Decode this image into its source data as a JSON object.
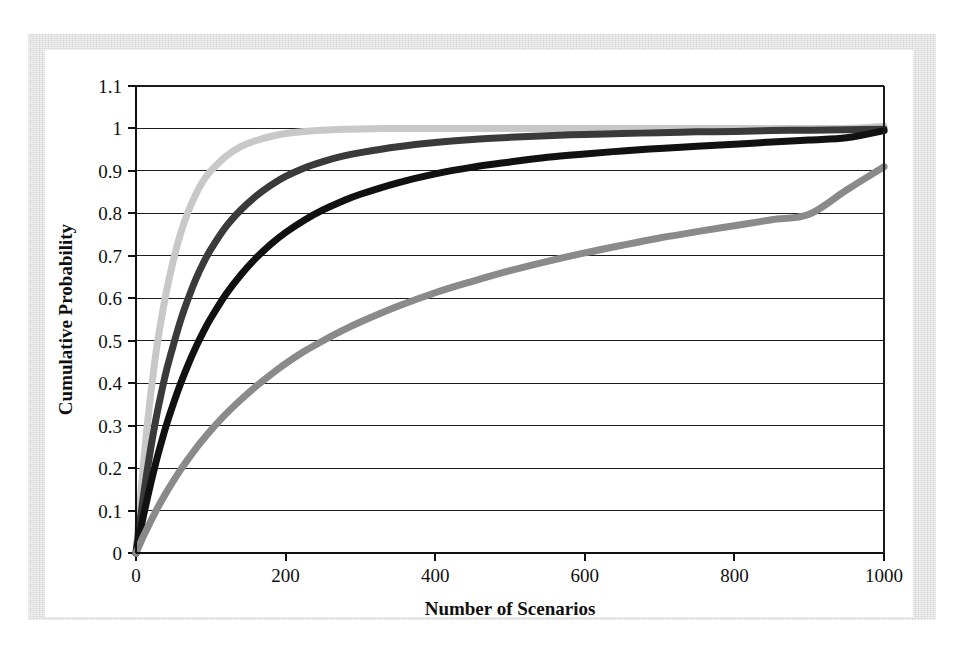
{
  "figure": {
    "kind": "scanned-figure-plate",
    "frame_color": "#dedede",
    "plate_color": "#ffffff"
  },
  "chart_data": {
    "type": "line",
    "title": "",
    "subtitle": "",
    "xlabel": "Number of Scenarios",
    "ylabel": "Cumulative Probability",
    "xlim": [
      0,
      1000
    ],
    "ylim": [
      0,
      1.1
    ],
    "xticks": [
      0,
      200,
      400,
      600,
      800,
      1000
    ],
    "xtick_labels": [
      "0",
      "200",
      "400",
      "600",
      "800",
      "1000"
    ],
    "yticks": [
      0,
      0.1,
      0.2,
      0.3,
      0.4,
      0.5,
      0.6,
      0.7,
      0.8,
      0.9,
      1,
      1.1
    ],
    "ytick_labels": [
      "0",
      "0.1",
      "0.2",
      "0.3",
      "0.4",
      "0.5",
      "0.6",
      "0.7",
      "0.8",
      "0.9",
      "1",
      "1.1"
    ],
    "grid": "horizontal",
    "legend": "none",
    "x": [
      0,
      5,
      10,
      15,
      20,
      25,
      30,
      40,
      50,
      60,
      70,
      80,
      90,
      100,
      120,
      140,
      160,
      180,
      200,
      225,
      250,
      275,
      300,
      350,
      400,
      450,
      500,
      550,
      600,
      650,
      700,
      750,
      800,
      850,
      900,
      950,
      1000
    ],
    "series": [
      {
        "name": "fastest-convergence",
        "color": "#c8c8c8",
        "stroke_width": 7,
        "values": [
          0,
          0.11,
          0.21,
          0.3,
          0.38,
          0.45,
          0.51,
          0.61,
          0.69,
          0.755,
          0.805,
          0.845,
          0.877,
          0.9,
          0.934,
          0.957,
          0.971,
          0.981,
          0.988,
          0.993,
          0.996,
          0.998,
          0.999,
          1.0,
          1.0,
          1.0,
          1.0,
          1.0,
          1.0,
          1.0,
          1.0,
          1.0,
          1.0,
          1.0,
          1.0,
          1.0,
          1.005
        ]
      },
      {
        "name": "second-convergence",
        "color": "#3a3a3a",
        "stroke_width": 7,
        "values": [
          0,
          0.07,
          0.135,
          0.195,
          0.25,
          0.3,
          0.345,
          0.425,
          0.49,
          0.55,
          0.6,
          0.645,
          0.683,
          0.715,
          0.768,
          0.808,
          0.84,
          0.866,
          0.887,
          0.907,
          0.922,
          0.934,
          0.943,
          0.957,
          0.967,
          0.974,
          0.979,
          0.983,
          0.986,
          0.988,
          0.99,
          0.992,
          0.993,
          0.995,
          0.996,
          0.997,
          0.998
        ]
      },
      {
        "name": "third-convergence",
        "color": "#111111",
        "stroke_width": 7,
        "values": [
          0,
          0.045,
          0.088,
          0.128,
          0.166,
          0.202,
          0.236,
          0.298,
          0.352,
          0.401,
          0.445,
          0.485,
          0.521,
          0.553,
          0.609,
          0.655,
          0.694,
          0.727,
          0.755,
          0.784,
          0.808,
          0.828,
          0.845,
          0.872,
          0.893,
          0.909,
          0.921,
          0.932,
          0.94,
          0.947,
          0.953,
          0.958,
          0.963,
          0.968,
          0.973,
          0.978,
          0.995
        ]
      },
      {
        "name": "slowest-convergence",
        "color": "#8a8a8a",
        "stroke_width": 7,
        "values": [
          0,
          0.02,
          0.04,
          0.058,
          0.076,
          0.093,
          0.11,
          0.141,
          0.17,
          0.197,
          0.222,
          0.246,
          0.268,
          0.289,
          0.327,
          0.361,
          0.392,
          0.42,
          0.446,
          0.475,
          0.5,
          0.523,
          0.544,
          0.581,
          0.613,
          0.64,
          0.665,
          0.687,
          0.707,
          0.725,
          0.742,
          0.757,
          0.771,
          0.785,
          0.798,
          0.855,
          0.91
        ]
      }
    ]
  }
}
